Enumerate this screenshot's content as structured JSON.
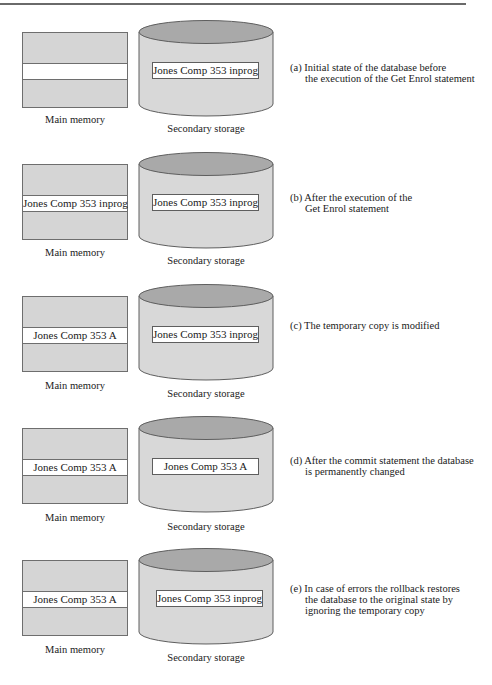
{
  "figure": {
    "panels": [
      {
        "id": "a",
        "main_memory": {
          "label": "Main memory",
          "record": ""
        },
        "secondary_storage": {
          "label": "Secondary storage",
          "record": "Jones Comp 353 inprog"
        },
        "caption": {
          "line1": "(a) Initial state of the database before",
          "line2": "the execution of the Get Enrol statement",
          "line3": ""
        }
      },
      {
        "id": "b",
        "main_memory": {
          "label": "Main memory",
          "record": "Jones Comp 353 inprog"
        },
        "secondary_storage": {
          "label": "Secondary storage",
          "record": "Jones Comp 353 inprog"
        },
        "caption": {
          "line1": "(b) After the execution of the",
          "line2": "Get Enrol statement",
          "line3": ""
        }
      },
      {
        "id": "c",
        "main_memory": {
          "label": "Main memory",
          "record": "Jones Comp 353 A"
        },
        "secondary_storage": {
          "label": "Secondary storage",
          "record": "Jones Comp 353 inprog"
        },
        "caption": {
          "line1": "(c) The temporary copy is modified",
          "line2": "",
          "line3": ""
        }
      },
      {
        "id": "d",
        "main_memory": {
          "label": "Main memory",
          "record": "Jones Comp 353 A"
        },
        "secondary_storage": {
          "label": "Secondary storage",
          "record": "Jones Comp 353 A"
        },
        "caption": {
          "line1": "(d) After the commit statement the database",
          "line2": "is permanently changed",
          "line3": ""
        }
      },
      {
        "id": "e",
        "main_memory": {
          "label": "Main memory",
          "record": "Jones Comp 353 A"
        },
        "secondary_storage": {
          "label": "Secondary storage",
          "record": "Jones Comp 353 inprog"
        },
        "caption": {
          "line1": "(e) In case of errors the rollback restores",
          "line2": "the database to the original state by",
          "line3": "ignoring the temporary copy"
        }
      }
    ],
    "colors": {
      "memory_fill": "#d5d5d5",
      "cylinder_body": "#d8d8d8",
      "cylinder_top": "#a9a9a9",
      "record_fill": "#ffffff",
      "stroke": "#5e5e5e"
    }
  }
}
